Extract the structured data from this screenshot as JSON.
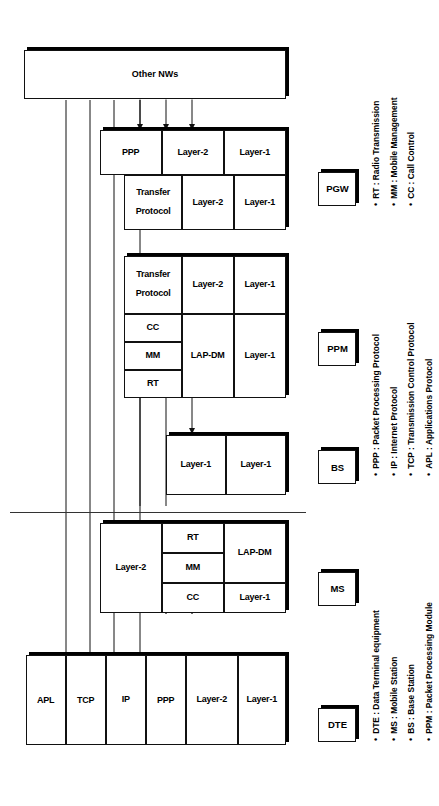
{
  "figure": {
    "other_nw": {
      "line1": "Other",
      "line2": "NWs"
    }
  },
  "nodes": [
    {
      "id": "dte",
      "label": "DTE"
    },
    {
      "id": "ms",
      "label": "MS"
    },
    {
      "id": "bs",
      "label": "BS"
    },
    {
      "id": "ppm",
      "label": "PPM"
    },
    {
      "id": "pgw",
      "label": "PGW"
    }
  ],
  "stacks": {
    "dte": {
      "name": "DTE",
      "cells": [
        {
          "text": "APL"
        },
        {
          "text": "TCP"
        },
        {
          "text": "IP"
        },
        {
          "text": "PPP"
        },
        {
          "text": "Layer-2"
        },
        {
          "text": "Layer-1"
        }
      ]
    },
    "ms": {
      "name": "MS",
      "upper": [
        {
          "text": "Layer-2"
        },
        {
          "text": "CC"
        },
        {
          "text": "MM"
        },
        {
          "text": "RT"
        }
      ],
      "lower": [
        {
          "text": "Layer-1"
        },
        {
          "text": "LAP-DM"
        },
        {
          "text": "Layer-1"
        }
      ]
    },
    "bs": {
      "name": "BS",
      "cells": [
        {
          "text": "Layer-1"
        },
        {
          "text": "Layer-1"
        }
      ]
    },
    "ppm": {
      "name": "PPM",
      "upper": [
        {
          "text": "RT"
        },
        {
          "text": "MM"
        },
        {
          "text": "CC"
        },
        {
          "text": "Transfer\nProtocol"
        }
      ],
      "lower": [
        {
          "text": "Layer-1"
        },
        {
          "text": "LAP-DM"
        },
        {
          "text": "Layer-2"
        }
      ],
      "bottom": [
        {
          "text": "Layer-1"
        }
      ]
    },
    "pgw": {
      "name": "PGW",
      "cells": [
        {
          "text": "Transfer\nProtocol"
        },
        {
          "text": "Layer-2"
        },
        {
          "text": "Layer-1"
        },
        {
          "text": "PPP"
        },
        {
          "text": "Layer-2"
        },
        {
          "text": "Layer-1"
        }
      ]
    }
  },
  "legend": {
    "column_1": [
      "DTE : Data Terminal equipment",
      "MS : Mobile Station",
      "BS : Base Station",
      "PPM : Packet Processing Module"
    ],
    "column_2": [
      "PPP : Packet Processing Protocol",
      "IP : Internet Protocol",
      "TCP : Transmission Control Protocol",
      "APL : Applications Protocol"
    ],
    "column_3": [
      "RT : Radio Transmission",
      "MM : Mobile Management",
      "CC : Call Control"
    ]
  },
  "labels": {
    "apl": "APL",
    "tcp": "TCP",
    "ip": "IP",
    "ppp": "PPP",
    "layer1": "Layer-1",
    "layer2": "Layer-2",
    "lapdm": "LAP-DM",
    "rt": "RT",
    "mm": "MM",
    "cc": "CC",
    "transfer_l1": "Transfer",
    "transfer_l2": "Protocol"
  },
  "colors": {
    "ink": "#000000",
    "line": "#111111",
    "paper": "#ffffff"
  }
}
